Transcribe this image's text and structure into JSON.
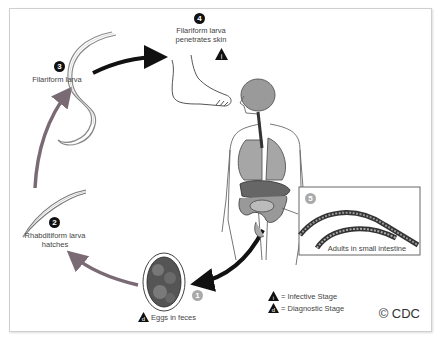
{
  "diagram": {
    "type": "life-cycle",
    "copyright": "© CDC",
    "stages": [
      {
        "number": "1",
        "label": "Eggs in feces",
        "marker": "diagnostic"
      },
      {
        "number": "2",
        "label_line1": "Rhabditiform larva",
        "label_line2": "hatches"
      },
      {
        "number": "3",
        "label": "Filariform larva"
      },
      {
        "number": "4",
        "label_line1": "Filariform larva",
        "label_line2": "penetrates skin",
        "marker": "infective"
      },
      {
        "number": "5",
        "label": "Adults in small intestine"
      }
    ],
    "legend": {
      "infective": "= Infective Stage",
      "diagnostic": "= Diagnostic Stage",
      "infective_symbol": "i",
      "diagnostic_symbol": "d"
    },
    "colors": {
      "frame": "#cfcfcf",
      "arrow_dark": "#111111",
      "arrow_grey": "#7a6a74",
      "organ_grey": "#8a8a8a",
      "text": "#444444"
    }
  }
}
